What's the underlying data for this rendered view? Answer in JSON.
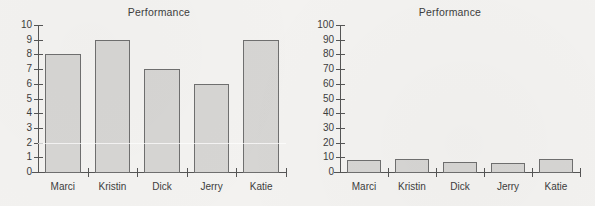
{
  "chart_data": [
    {
      "id": "left",
      "type": "bar",
      "title": "Performance",
      "xlabel": "",
      "ylabel": "",
      "categories": [
        "Marci",
        "Kristin",
        "Dick",
        "Jerry",
        "Katie"
      ],
      "values": [
        8,
        9,
        7,
        6,
        9
      ],
      "ylim": [
        0,
        10
      ],
      "yticks": [
        0,
        1,
        2,
        3,
        4,
        5,
        6,
        7,
        8,
        9,
        10
      ],
      "ytick_labels": [
        "0",
        "1",
        "2",
        "3",
        "4",
        "5",
        "6",
        "7",
        "8",
        "9",
        "10"
      ],
      "grid": false,
      "legend": false,
      "bar_color": "#d6d5d3",
      "bar_edge_color": "#6f6f6f",
      "axis_color": "#555555",
      "text_color": "#3d3d3d"
    },
    {
      "id": "right",
      "type": "bar",
      "title": "Performance",
      "xlabel": "",
      "ylabel": "",
      "categories": [
        "Marci",
        "Kristin",
        "Dick",
        "Jerry",
        "Katie"
      ],
      "values": [
        8,
        9,
        7,
        6,
        9
      ],
      "ylim": [
        0,
        100
      ],
      "yticks": [
        0,
        10,
        20,
        30,
        40,
        50,
        60,
        70,
        80,
        90,
        100
      ],
      "ytick_labels": [
        "0",
        "10",
        "20",
        "30",
        "40",
        "50",
        "60",
        "70",
        "80",
        "90",
        "100"
      ],
      "grid": false,
      "legend": false,
      "bar_color": "#d6d5d3",
      "bar_edge_color": "#6f6f6f",
      "axis_color": "#555555",
      "text_color": "#3d3d3d"
    }
  ],
  "page": {
    "background_color": "#f3f2f0"
  }
}
